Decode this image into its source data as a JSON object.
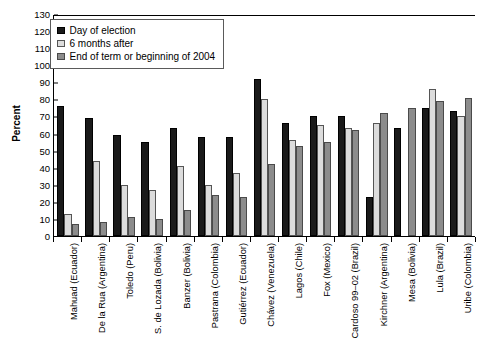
{
  "chart_data": {
    "type": "bar",
    "title": "",
    "xlabel": "",
    "ylabel": "Percent",
    "ylim": [
      0,
      130
    ],
    "ytick_step": 10,
    "yticks": [
      0,
      10,
      20,
      30,
      40,
      50,
      60,
      70,
      80,
      90,
      100,
      110,
      120,
      130
    ],
    "grid": false,
    "legend_position": "top-left",
    "categories": [
      "Mahuad (Ecuador)",
      "De la Rua (Argentina)",
      "Toledo (Peru)",
      "S. de Lozada (Bolivia)",
      "Banzer (Bolivia)",
      "Pastrana (Colombia)",
      "Gutiérrez (Ecuador)",
      "Chávez (Venezuela)",
      "Lagos (Chile)",
      "Fox (Mexico)",
      "Cardoso 99–02 (Brazil)",
      "Kirchner (Argentina)",
      "Mesa (Bolivia)",
      "Lula (Brazil)",
      "Uribe (Colombia)"
    ],
    "series": [
      {
        "name": "Day of election",
        "color": "#1a1a1a",
        "values": [
          76,
          69,
          59,
          55,
          63,
          58,
          58,
          92,
          66,
          70,
          70,
          23,
          63,
          75,
          73
        ]
      },
      {
        "name": "6 months after",
        "color": "#dcdcdc",
        "values": [
          13,
          44,
          30,
          27,
          41,
          30,
          37,
          80,
          56,
          65,
          63,
          66,
          null,
          86,
          70
        ]
      },
      {
        "name": "End of term or beginning of 2004",
        "color": "#8c8c8c",
        "values": [
          7,
          8,
          11,
          10,
          15,
          24,
          23,
          42,
          53,
          55,
          62,
          72,
          75,
          79,
          81
        ]
      }
    ]
  },
  "legend": {
    "items": [
      {
        "label": "Day of election"
      },
      {
        "label": "6 months after"
      },
      {
        "label": "End of term or beginning of 2004"
      }
    ]
  }
}
